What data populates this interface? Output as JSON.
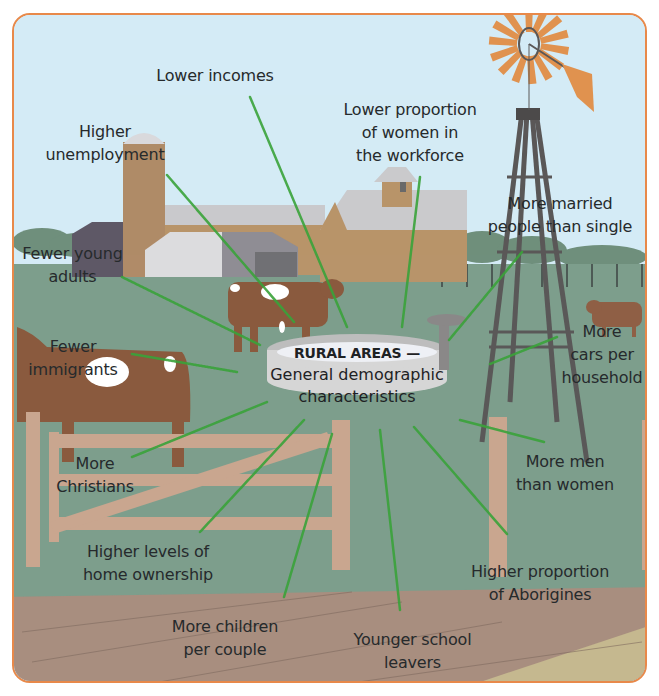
{
  "diagram": {
    "center": {
      "title": "RURAL AREAS —",
      "subtitle_line1": "General demographic",
      "subtitle_line2": "characteristics"
    },
    "characteristics": [
      {
        "id": "lower-incomes",
        "line1": "Lower incomes",
        "line2": ""
      },
      {
        "id": "higher-unemployment",
        "line1": "Higher",
        "line2": "unemployment"
      },
      {
        "id": "lower-women-workforce",
        "line1": "Lower proportion",
        "line2": "of women in",
        "line3": "the workforce"
      },
      {
        "id": "more-married",
        "line1": "More married",
        "line2": "people than single"
      },
      {
        "id": "fewer-young-adults",
        "line1": "Fewer young",
        "line2": "adults"
      },
      {
        "id": "fewer-immigrants",
        "line1": "Fewer",
        "line2": "immigrants"
      },
      {
        "id": "more-cars",
        "line1": "More",
        "line2": "cars per",
        "line3": "household"
      },
      {
        "id": "more-christians",
        "line1": "More",
        "line2": "Christians"
      },
      {
        "id": "more-men",
        "line1": "More men",
        "line2": "than women"
      },
      {
        "id": "home-ownership",
        "line1": "Higher levels of",
        "line2": "home ownership"
      },
      {
        "id": "aborigines",
        "line1": "Higher proportion",
        "line2": "of Aborigines"
      },
      {
        "id": "more-children",
        "line1": "More children",
        "line2": "per couple"
      },
      {
        "id": "younger-school-leavers",
        "line1": "Younger school",
        "line2": "leavers"
      }
    ],
    "colors": {
      "frame_border": "#e8894a",
      "sky": "#d4ebf6",
      "grass": "#7d9e8c",
      "dirt": "#a88e7f",
      "sand": "#c5b88f",
      "connector": "#3aa33a",
      "windmill_blades": "#e0924f",
      "cow": "#8a5a3e",
      "barn_wood": "#b8946a"
    }
  }
}
